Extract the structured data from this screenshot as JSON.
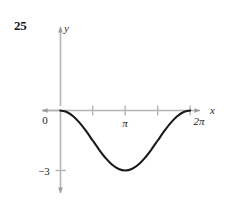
{
  "figure": {
    "problem_number": "25",
    "background_color": "#ffffff",
    "axis_color": "#b4b4b4",
    "curve_color": "#1a1a1a",
    "text_color": "#1e1e1e"
  },
  "chart_data": {
    "type": "line",
    "title": "",
    "xlabel": "x",
    "ylabel": "y",
    "xlim": [
      -0.55,
      7.55
    ],
    "ylim": [
      -4.6,
      3.2
    ],
    "grid": false,
    "legend": null,
    "x_axis": {
      "label": "x",
      "tick_values": [
        0,
        1.5707963,
        3.1415927,
        4.712389,
        6.2831853
      ],
      "tick_labels": [
        "0",
        "",
        "π",
        "",
        "2π"
      ],
      "arrow_both_ends": true
    },
    "y_axis": {
      "label": "y",
      "tick_values": [
        -3
      ],
      "tick_labels": [
        "−3"
      ],
      "arrow_both_ends": true
    },
    "series": [
      {
        "name": "y = 1.5(cos x − 1)",
        "equation": "y = 1.5*cos(x) - 1.5",
        "x_start": 0,
        "x_end": 6.2831853,
        "points": [
          {
            "x": 0.0,
            "y": 0.0
          },
          {
            "x": 0.3141593,
            "y": -0.0734
          },
          {
            "x": 0.6283185,
            "y": -0.2865
          },
          {
            "x": 0.9424778,
            "y": -0.6185
          },
          {
            "x": 1.2566371,
            "y": -1.0365
          },
          {
            "x": 1.5707963,
            "y": -1.5
          },
          {
            "x": 1.8849556,
            "y": -1.9635
          },
          {
            "x": 2.1991149,
            "y": -2.3815
          },
          {
            "x": 2.5132741,
            "y": -2.7135
          },
          {
            "x": 2.8274334,
            "y": -2.9266
          },
          {
            "x": 3.1415927,
            "y": -3.0
          },
          {
            "x": 3.4557519,
            "y": -2.9266
          },
          {
            "x": 3.7699112,
            "y": -2.7135
          },
          {
            "x": 4.0840704,
            "y": -2.3815
          },
          {
            "x": 4.3982297,
            "y": -1.9635
          },
          {
            "x": 4.712389,
            "y": -1.5
          },
          {
            "x": 5.0265482,
            "y": -1.0365
          },
          {
            "x": 5.3407075,
            "y": -0.6185
          },
          {
            "x": 5.6548668,
            "y": -0.2865
          },
          {
            "x": 5.969026,
            "y": -0.0734
          },
          {
            "x": 6.2831853,
            "y": 0.0
          }
        ],
        "min_point": {
          "x": 3.1415927,
          "y": -3.0
        },
        "color": "#1a1a1a",
        "line_width": 2.1
      }
    ],
    "annotations": [
      {
        "text": "25",
        "role": "problem-number"
      }
    ]
  }
}
